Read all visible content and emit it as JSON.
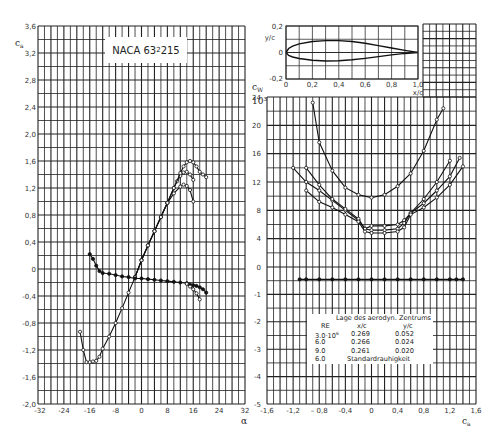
{
  "chart_data": [
    {
      "type": "line",
      "title": "NACA 63₂ 215",
      "title_parts": {
        "main": "NACA 63",
        "sub": "2",
        "tail": " 215"
      },
      "xlabel": "α",
      "ylabel": "cₐ",
      "xlim": [
        -32,
        32
      ],
      "ylim": [
        -2.0,
        3.6
      ],
      "x_ticks": [
        "-32",
        "-24",
        "-16",
        "-8",
        "0",
        "8",
        "16",
        "24",
        "32"
      ],
      "y_ticks": [
        "3,6",
        "3,2",
        "2,8",
        "2,4",
        "2,0",
        "1,6",
        "1,2",
        "0,8",
        "0,4",
        "0",
        "-0,4",
        "-0,8",
        "-1,2",
        "-1,6",
        "-2,0"
      ],
      "grid": true,
      "series": [
        {
          "name": "ca Re=3.0e6",
          "x": [
            -19,
            -18,
            -17,
            -16,
            -15,
            -14,
            -13,
            -12,
            -10,
            -8,
            -6,
            -4,
            -2,
            0,
            2,
            4,
            6,
            8,
            10,
            12,
            13,
            14,
            15,
            16
          ],
          "y": [
            -0.93,
            -1.2,
            -1.38,
            -1.38,
            -1.37,
            -1.36,
            -1.3,
            -1.18,
            -1.0,
            -0.8,
            -0.58,
            -0.35,
            -0.12,
            0.13,
            0.35,
            0.56,
            0.77,
            0.98,
            1.12,
            1.22,
            1.25,
            1.23,
            1.17,
            1.0
          ]
        },
        {
          "name": "ca Re=6.0e6",
          "x": [
            -2,
            0,
            2,
            4,
            6,
            8,
            10,
            11,
            12,
            13,
            14,
            15,
            16
          ],
          "y": [
            -0.12,
            0.13,
            0.35,
            0.56,
            0.77,
            0.98,
            1.2,
            1.3,
            1.38,
            1.43,
            1.44,
            1.4,
            1.32
          ]
        },
        {
          "name": "ca Re=9.0e6",
          "x": [
            -2,
            0,
            2,
            4,
            6,
            8,
            10,
            12,
            13,
            14,
            15,
            16,
            17,
            18,
            19,
            20
          ],
          "y": [
            -0.12,
            0.13,
            0.35,
            0.56,
            0.77,
            0.98,
            1.2,
            1.42,
            1.52,
            1.58,
            1.6,
            1.58,
            1.52,
            1.44,
            1.4,
            1.36
          ]
        },
        {
          "name": "cm (upper branch)",
          "x": [
            -16,
            -15,
            -14,
            -13,
            -12,
            -10,
            -8,
            -6,
            -4,
            -2,
            0,
            2,
            4,
            6,
            8,
            10,
            12,
            14,
            15,
            16,
            17,
            18,
            19,
            20
          ],
          "y": [
            0.22,
            0.15,
            0.05,
            -0.03,
            -0.06,
            -0.07,
            -0.09,
            -0.11,
            -0.12,
            -0.14,
            -0.14,
            -0.15,
            -0.16,
            -0.17,
            -0.18,
            -0.19,
            -0.2,
            -0.21,
            -0.23,
            -0.24,
            -0.25,
            -0.27,
            -0.3,
            -0.35
          ]
        },
        {
          "name": "cm (lower branch)",
          "x": [
            14,
            15,
            16,
            17,
            18
          ],
          "y": [
            -0.22,
            -0.26,
            -0.3,
            -0.36,
            -0.45
          ]
        }
      ]
    },
    {
      "type": "line",
      "title": "NACA 63₂ 215 Profilkontur",
      "xlabel": "x/c",
      "ylabel": "y/c",
      "xlim": [
        0,
        1.0
      ],
      "ylim": [
        -0.2,
        0.2
      ],
      "x_ticks": [
        "0",
        "0,2",
        "0,4",
        "0,6",
        "0,8",
        "1,0"
      ],
      "y_ticks": [
        "0,2",
        "0",
        "-0,2"
      ],
      "grid": true,
      "series": [
        {
          "name": "upper surface",
          "x": [
            0,
            0.02,
            0.05,
            0.1,
            0.2,
            0.3,
            0.4,
            0.5,
            0.6,
            0.7,
            0.8,
            0.9,
            1.0
          ],
          "y": [
            0,
            0.03,
            0.048,
            0.065,
            0.083,
            0.09,
            0.09,
            0.083,
            0.07,
            0.052,
            0.034,
            0.016,
            0
          ]
        },
        {
          "name": "lower surface",
          "x": [
            0,
            0.02,
            0.05,
            0.1,
            0.2,
            0.3,
            0.4,
            0.5,
            0.6,
            0.7,
            0.8,
            0.9,
            1.0
          ],
          "y": [
            0,
            -0.022,
            -0.034,
            -0.045,
            -0.058,
            -0.064,
            -0.062,
            -0.055,
            -0.044,
            -0.031,
            -0.018,
            -0.007,
            0
          ]
        }
      ]
    },
    {
      "type": "line",
      "title": "",
      "xlabel": "cₐ",
      "ylabel": "c_W · 10³",
      "ylabel_main": "c",
      "ylabel_sub": "W",
      "ylabel_power": "10³",
      "xlim": [
        -1.6,
        1.6
      ],
      "ylim_cw": [
        0,
        24
      ],
      "ylim_cm": [
        -5,
        0
      ],
      "x_ticks": [
        "-1,6",
        "-1,2",
        "– 0,8",
        "-0,4",
        "0",
        "0,4",
        "0,8",
        "1,2",
        "1,6"
      ],
      "y_ticks_cw": [
        "24",
        "20",
        "16",
        "12",
        "8",
        "4",
        "0"
      ],
      "y_ticks_cm": [
        "-1",
        "-2",
        "-3",
        "-4",
        "-5"
      ],
      "grid": true,
      "series": [
        {
          "name": "cw standard roughness Re=6.0e6",
          "x": [
            -0.9,
            -0.8,
            -0.6,
            -0.4,
            -0.2,
            0,
            0.2,
            0.4,
            0.6,
            0.8,
            1.0,
            1.1
          ],
          "y": [
            23.2,
            17.6,
            13.6,
            11.2,
            10.2,
            9.8,
            10.2,
            11.4,
            13.2,
            16.4,
            20.8,
            22.4
          ]
        },
        {
          "name": "cw Re=3.0e6",
          "x": [
            -1.2,
            -1.0,
            -0.8,
            -0.6,
            -0.4,
            -0.2,
            -0.1,
            0,
            0.2,
            0.4,
            0.5,
            0.6,
            0.8,
            1.0,
            1.2
          ],
          "y": [
            14.0,
            12.0,
            10.8,
            9.4,
            8.0,
            6.6,
            5.4,
            5.8,
            5.8,
            6.0,
            6.6,
            7.6,
            9.6,
            12.0,
            15.0
          ]
        },
        {
          "name": "cw Re=6.0e6",
          "x": [
            -1.0,
            -0.8,
            -0.6,
            -0.4,
            -0.2,
            -0.1,
            0,
            0.2,
            0.4,
            0.5,
            0.6,
            0.8,
            1.0,
            1.2,
            1.35
          ],
          "y": [
            14.0,
            11.6,
            9.6,
            8.2,
            6.8,
            5.4,
            5.2,
            5.2,
            5.4,
            6.2,
            7.6,
            9.0,
            10.8,
            12.8,
            15.4
          ]
        },
        {
          "name": "cw Re=9.0e6",
          "x": [
            -1.0,
            -0.8,
            -0.6,
            -0.4,
            -0.2,
            -0.1,
            0,
            0.2,
            0.4,
            0.5,
            0.6,
            0.8,
            1.0,
            1.2,
            1.4
          ],
          "y": [
            10.8,
            9.2,
            8.4,
            7.4,
            6.4,
            5.0,
            4.8,
            4.8,
            5.0,
            5.6,
            7.4,
            8.4,
            9.8,
            11.6,
            14.2
          ]
        },
        {
          "name": "cm (c/4) ×100",
          "x": [
            -1.1,
            -1.0,
            -0.8,
            -0.6,
            -0.4,
            -0.2,
            0,
            0.2,
            0.4,
            0.6,
            0.8,
            1.0,
            1.2,
            1.3,
            1.4
          ],
          "y": [
            -0.45,
            -0.45,
            -0.45,
            -0.45,
            -0.45,
            -0.45,
            -0.45,
            -0.45,
            -0.45,
            -0.45,
            -0.45,
            -0.45,
            -0.45,
            -0.45,
            -0.45
          ],
          "axis": "cm"
        }
      ]
    }
  ],
  "legend": {
    "header": "Lage des aerodyn. Zentrums",
    "columns": [
      "RE",
      "x/c",
      "y/c"
    ],
    "rows": [
      {
        "re": "3.0·10",
        "re_sup": "6",
        "xc": "0.269",
        "yc": "0.052"
      },
      {
        "re": "6.0",
        "re_sup": "",
        "xc": "0.266",
        "yc": "0.024"
      },
      {
        "re": "9.0",
        "re_sup": "",
        "xc": "0.261",
        "yc": "0.020"
      },
      {
        "re": "6.0",
        "re_sup": "",
        "xc": "Standardrauhigkeit",
        "yc": ""
      }
    ]
  },
  "labels": {
    "title_main": "NACA 63",
    "title_sub": "2",
    "title_tail": " 215",
    "left_ylabel": "c",
    "left_ylabel_sub": "a",
    "left_xlabel": "α",
    "right_xlabel": "c",
    "right_xlabel_sub": "a",
    "inset_ylabel": "y/c",
    "inset_xlabel": "x/c",
    "cw_label": "c",
    "cw_label_sub": "W",
    "cw_power": "10³"
  }
}
